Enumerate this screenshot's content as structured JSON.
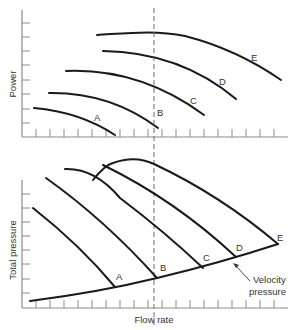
{
  "figure": {
    "top_panel": {
      "ylabel": "Power",
      "curves": [
        {
          "id": "A",
          "label": "A"
        },
        {
          "id": "B",
          "label": "B"
        },
        {
          "id": "C",
          "label": "C"
        },
        {
          "id": "D",
          "label": "D"
        },
        {
          "id": "E",
          "label": "E"
        }
      ]
    },
    "bottom_panel": {
      "ylabel": "Total pressure",
      "xlabel": "Flow rate",
      "curves": [
        {
          "id": "A",
          "label": "A"
        },
        {
          "id": "B",
          "label": "B"
        },
        {
          "id": "C",
          "label": "C"
        },
        {
          "id": "D",
          "label": "D"
        },
        {
          "id": "E",
          "label": "E"
        }
      ],
      "annotation": {
        "line1": "Velocity",
        "line2": "pressure"
      }
    },
    "colors": {
      "curve": "#1a1a1a",
      "axis": "#8a8a8a",
      "text": "#333333",
      "background": "#ffffff"
    }
  }
}
